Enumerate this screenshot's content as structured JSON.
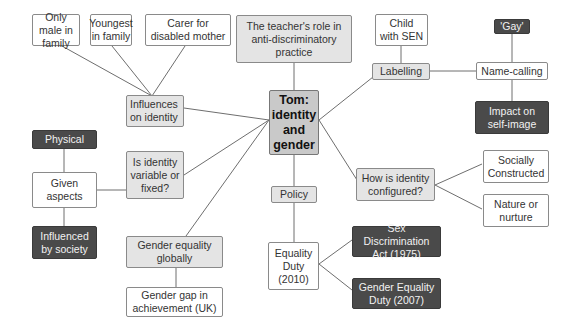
{
  "diagram": {
    "type": "mind-map",
    "central": "Tom: identity and gender",
    "nodes": {
      "central": "Tom: identity and gender",
      "teacher_role": "The teacher's role in anti-discriminatory practice",
      "influences": "Influences on identity",
      "only_male": "Only male in family",
      "youngest": "Youngest in family",
      "carer": "Carer for disabled mother",
      "child_sen": "Child with SEN",
      "labelling": "Labelling",
      "name_calling": "Name-calling",
      "gay": "'Gay'",
      "impact": "Impact on self-image",
      "physical": "Physical",
      "given_aspects": "Given aspects",
      "influenced_society": "Influenced by society",
      "variable_fixed": "Is identity variable or fixed?",
      "how_configured": "How is identity configured?",
      "socially_constructed": "Socially Constructed",
      "nature_nurture": "Nature or nurture",
      "policy": "Policy",
      "equality_duty": "Equality Duty (2010)",
      "sex_discrimination": "Sex Discrimination Act (1975)",
      "gender_equality_duty": "Gender Equality Duty (2007)",
      "gender_equality_globally": "Gender equality globally",
      "gender_gap": "Gender gap in achievement (UK)"
    },
    "edges": [
      [
        "central",
        "teacher_role"
      ],
      [
        "central",
        "influences"
      ],
      [
        "central",
        "variable_fixed"
      ],
      [
        "central",
        "gender_equality_globally"
      ],
      [
        "central",
        "labelling"
      ],
      [
        "central",
        "how_configured"
      ],
      [
        "central",
        "policy"
      ],
      [
        "influences",
        "only_male"
      ],
      [
        "influences",
        "youngest"
      ],
      [
        "influences",
        "carer"
      ],
      [
        "labelling",
        "child_sen"
      ],
      [
        "labelling",
        "name_calling"
      ],
      [
        "name_calling",
        "gay"
      ],
      [
        "name_calling",
        "impact"
      ],
      [
        "variable_fixed",
        "given_aspects"
      ],
      [
        "given_aspects",
        "physical"
      ],
      [
        "given_aspects",
        "influenced_society"
      ],
      [
        "how_configured",
        "socially_constructed"
      ],
      [
        "how_configured",
        "nature_nurture"
      ],
      [
        "policy",
        "equality_duty"
      ],
      [
        "equality_duty",
        "sex_discrimination"
      ],
      [
        "equality_duty",
        "gender_equality_duty"
      ],
      [
        "gender_equality_globally",
        "gender_gap"
      ]
    ],
    "colors": {
      "line": "#6e6e6e",
      "light_box": "#ffffff",
      "grey_box": "#e4e4e4",
      "dark_box": "#4a4a4a",
      "central_box": "#c9c9c9"
    }
  }
}
